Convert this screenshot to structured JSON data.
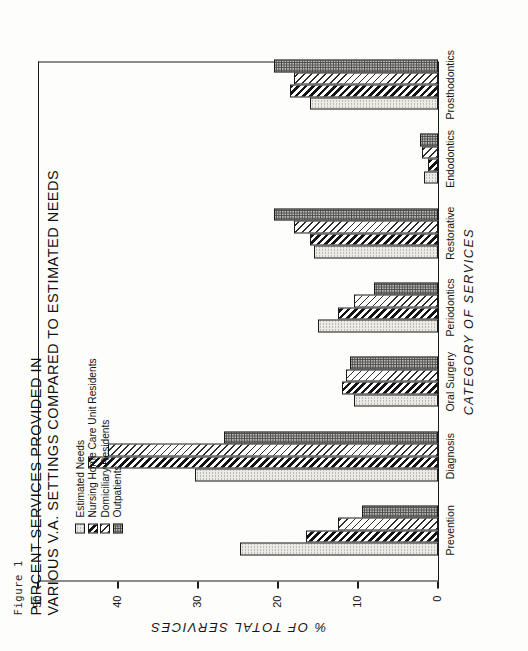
{
  "figure": {
    "caption": "Figure 1",
    "title": "PERCENT SERVICES PROVIDED IN\nVARIOUS V.A. SETTINGS COMPARED TO ESTIMATED NEEDS"
  },
  "legend": {
    "position": "upper-left-inside",
    "items": [
      {
        "label": "Estimated Needs",
        "pattern": "dots-light",
        "color": "#eceae4"
      },
      {
        "label": "Nursing Home Care Unit Residents",
        "pattern": "hatch-black",
        "color": "#141414"
      },
      {
        "label": "Domiciliary Residents",
        "pattern": "hatch-light",
        "color": "#2b2b2b"
      },
      {
        "label": "Outpatients",
        "pattern": "dots-dark",
        "color": "#b9b7b2"
      }
    ]
  },
  "chart_data": {
    "type": "bar",
    "orientation": "horizontal",
    "title": "PERCENT SERVICES PROVIDED IN VARIOUS V.A. SETTINGS COMPARED TO ESTIMATED NEEDS",
    "xlabel": "CATEGORY OF SERVICES",
    "ylabel": "% OF TOTAL SERVICES",
    "ylim": [
      0,
      50
    ],
    "yticks": [
      0,
      10,
      20,
      30,
      40,
      50
    ],
    "ytick_labels": [
      "0",
      "10",
      "20",
      "30",
      "40",
      "50"
    ],
    "grid": false,
    "categories": [
      "Prevention",
      "Diagnosis",
      "Oral Surgery",
      "Periodontics",
      "Restorative",
      "Endodontics",
      "Prosthodontics"
    ],
    "series": [
      {
        "name": "Estimated Needs",
        "values": [
          24.7,
          30.4,
          10.5,
          15.0,
          15.5,
          1.8,
          16.0
        ]
      },
      {
        "name": "Nursing Home Care Unit Residents",
        "values": [
          16.5,
          43.8,
          12.0,
          12.5,
          16.0,
          1.2,
          18.5
        ]
      },
      {
        "name": "Domiciliary Residents",
        "values": [
          12.5,
          41.2,
          11.5,
          10.5,
          18.0,
          2.0,
          18.0
        ]
      },
      {
        "name": "Outpatients",
        "values": [
          9.5,
          26.7,
          11.0,
          8.0,
          20.5,
          2.2,
          20.5
        ]
      }
    ]
  },
  "axis": {
    "y_title": "% OF TOTAL SERVICES",
    "x_title": "CATEGORY OF SERVICES",
    "tick_labels": [
      "50",
      "40",
      "30",
      "20",
      "10",
      "0"
    ]
  }
}
